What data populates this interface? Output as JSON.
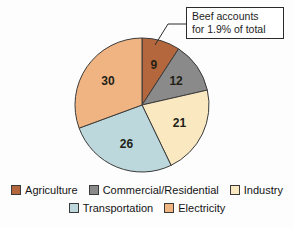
{
  "chart_data": {
    "type": "pie",
    "title": "",
    "categories": [
      "Agriculture",
      "Commercial/Residential",
      "Industry",
      "Transportation",
      "Electricity"
    ],
    "values": [
      9,
      12,
      21,
      26,
      30
    ],
    "value_labels": [
      "9",
      "12",
      "21",
      "26",
      "30"
    ],
    "colors": [
      "#b4673c",
      "#8a8a8a",
      "#fae8c0",
      "#bcd8dc",
      "#f0b482"
    ],
    "units": "percent",
    "start_angle_deg": 0,
    "direction": "clockwise",
    "legend_position": "bottom",
    "grid": false,
    "xlabel": "",
    "ylabel": "",
    "annotations": [
      {
        "name": "beef-callout",
        "text_lines": [
          "Beef accounts",
          "for 1.9% of total"
        ],
        "points_to_category": "Agriculture",
        "value": 1.9
      }
    ]
  },
  "callout": {
    "line1": "Beef accounts",
    "line2": "for 1.9% of total"
  },
  "legend": {
    "rows": [
      [
        {
          "label": "Agriculture",
          "color": "#b4673c"
        },
        {
          "label": "Commercial/Residential",
          "color": "#8a8a8a"
        },
        {
          "label": "Industry",
          "color": "#fae8c0"
        }
      ],
      [
        {
          "label": "Transportation",
          "color": "#bcd8dc"
        },
        {
          "label": "Electricity",
          "color": "#f0b482"
        }
      ]
    ]
  },
  "slices": [
    {
      "label": "9",
      "category": "Agriculture"
    },
    {
      "label": "12",
      "category": "Commercial/Residential"
    },
    {
      "label": "21",
      "category": "Industry"
    },
    {
      "label": "26",
      "category": "Transportation"
    },
    {
      "label": "30",
      "category": "Electricity"
    }
  ],
  "style": {
    "background": "#fdfdfd",
    "outline": "#3a3a3a",
    "text": "#141414"
  }
}
